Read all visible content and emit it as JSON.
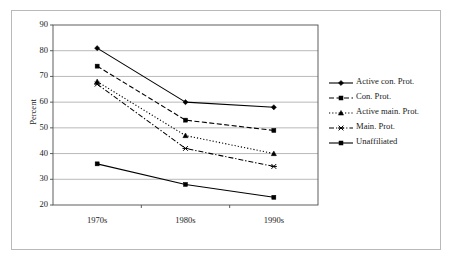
{
  "chart_data": {
    "type": "line",
    "title": "",
    "subtitle": "",
    "xlabel": "",
    "ylabel": "Percent",
    "categories": [
      "1970s",
      "1980s",
      "1990s"
    ],
    "ylim": [
      20,
      90
    ],
    "ytick_values": [
      20,
      30,
      40,
      50,
      60,
      70,
      80,
      90
    ],
    "ytick_labels": [
      "20",
      "30",
      "40",
      "50",
      "60",
      "70",
      "80",
      "90"
    ],
    "grid": "horizontal",
    "legend_position": "right",
    "series": [
      {
        "name": "Active con. Prot.",
        "values": [
          81,
          60,
          58
        ],
        "line_style": "solid",
        "marker": "diamond",
        "color": "#000000"
      },
      {
        "name": "Con. Prot.",
        "values": [
          74,
          53,
          49
        ],
        "line_style": "dashed",
        "marker": "square",
        "color": "#000000"
      },
      {
        "name": "Active main. Prot.",
        "values": [
          68,
          47,
          40
        ],
        "line_style": "dotted",
        "marker": "triangle",
        "color": "#000000"
      },
      {
        "name": "Main. Prot.",
        "values": [
          67,
          42,
          35
        ],
        "line_style": "dashdot",
        "marker": "x",
        "color": "#000000"
      },
      {
        "name": "Unaffiliated",
        "values": [
          36,
          28,
          23
        ],
        "line_style": "solid",
        "marker": "square",
        "color": "#000000"
      }
    ]
  },
  "colors": {
    "plot_border": "#4d4d4d",
    "gridline": "#9a9a9a",
    "figure_border": "#b9b9b9",
    "text": "#1a1a1a",
    "background": "#ffffff"
  },
  "legend": {
    "items": [
      {
        "label": "Active con. Prot."
      },
      {
        "label": "Con. Prot."
      },
      {
        "label": "Active main. Prot."
      },
      {
        "label": "Main. Prot."
      },
      {
        "label": "Unaffiliated"
      }
    ]
  }
}
